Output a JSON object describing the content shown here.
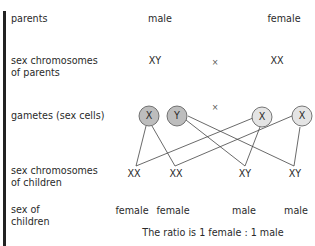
{
  "rows": {
    "parents": {
      "label": "parents",
      "male": "male",
      "female": "female"
    },
    "parent_chromosomes": {
      "label_line1": "sex chromosomes",
      "label_line2": "of parents",
      "male": "XY",
      "cross": "×",
      "female": "XX"
    },
    "gametes": {
      "label": "gametes (sex cells)",
      "cross": "×",
      "cells": [
        "X",
        "Y",
        "X",
        "X"
      ]
    },
    "child_chromosomes": {
      "label_line1": "sex chromosomes",
      "label_line2": "of children",
      "values": [
        "XX",
        "XX",
        "XY",
        "XY"
      ]
    },
    "child_sex": {
      "label_line1": "sex of",
      "label_line2": "children",
      "values": [
        "female",
        "female",
        "male",
        "male"
      ]
    }
  },
  "ratio_text": "The ratio is 1 female : 1 male",
  "colors": {
    "male_gamete_fill": "#bdbdbd",
    "female_gamete_fill": "#e4e4e4",
    "line": "#444444",
    "bar": "#222222"
  }
}
